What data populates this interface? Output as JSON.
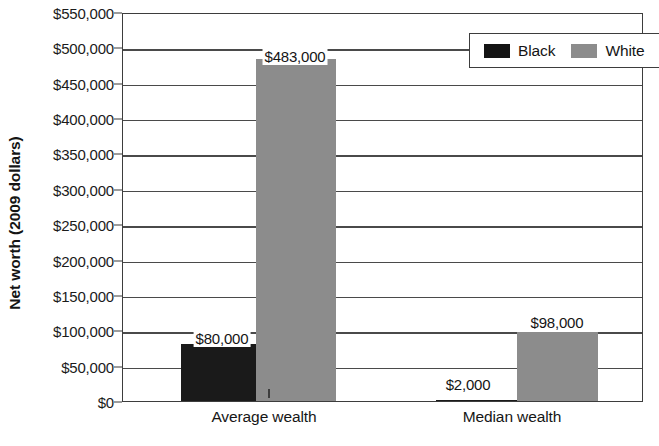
{
  "chart_data": {
    "type": "bar",
    "title": "",
    "xlabel": "",
    "ylabel": "Net worth (2009 dollars)",
    "categories": [
      "Average wealth",
      "Median wealth"
    ],
    "series": [
      {
        "name": "Black",
        "color": "#1a1a1a",
        "values": [
          80000,
          2000
        ],
        "labels": [
          "$80,000",
          "$2,000"
        ]
      },
      {
        "name": "White",
        "color": "#8c8c8c",
        "values": [
          483000,
          98000
        ],
        "labels": [
          "$483,000",
          "$98,000"
        ]
      }
    ],
    "ylim": [
      0,
      550000
    ],
    "ytick_step": 50000,
    "ytick_labels": [
      "$0",
      "$50,000",
      "$100,000",
      "$150,000",
      "$200,000",
      "$250,000",
      "$300,000",
      "$350,000",
      "$400,000",
      "$450,000",
      "$500,000",
      "$550,000"
    ],
    "ytick_values": [
      0,
      50000,
      100000,
      150000,
      200000,
      250000,
      300000,
      350000,
      400000,
      450000,
      500000,
      550000
    ],
    "grid": true,
    "legend_position": "top-right"
  },
  "axis": {
    "y_title": "Net worth (2009 dollars)"
  },
  "legend": {
    "entries": [
      {
        "label": "Black",
        "swatch": "black"
      },
      {
        "label": "White",
        "swatch": "white"
      }
    ]
  }
}
